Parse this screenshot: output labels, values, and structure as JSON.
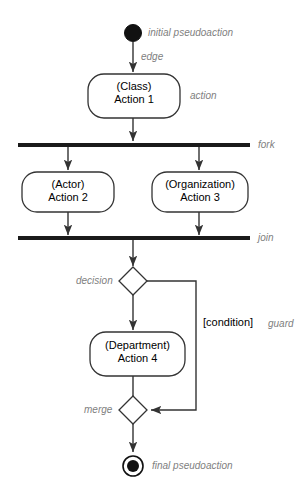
{
  "diagram": {
    "colors": {
      "stroke": "#333333",
      "bar": "#1a1a1a",
      "node_fill": "#ffffff",
      "annotation": "#808080",
      "text": "#000000",
      "background": "#ffffff"
    },
    "nodes": {
      "initial": {
        "type": "initial-node",
        "annotation": "initial pseudoaction"
      },
      "action1": {
        "type": "action",
        "line1": "(Class)",
        "line2": "Action 1",
        "annotation": "action"
      },
      "fork": {
        "type": "fork-bar",
        "annotation": "fork"
      },
      "action2": {
        "type": "action",
        "line1": "(Actor)",
        "line2": "Action 2"
      },
      "action3": {
        "type": "action",
        "line1": "(Organization)",
        "line2": "Action 3"
      },
      "join": {
        "type": "join-bar",
        "annotation": "join"
      },
      "decision": {
        "type": "decision-node",
        "annotation": "decision"
      },
      "action4": {
        "type": "action",
        "line1": "(Department)",
        "line2": "Action 4"
      },
      "merge": {
        "type": "merge-node",
        "annotation": "merge"
      },
      "final": {
        "type": "final-node",
        "annotation": "final pseudoaction"
      }
    },
    "edges": {
      "initial_to_action1": {
        "annotation": "edge"
      },
      "decision_branch": {
        "guard_text": "[condition]",
        "guard_annotation": "guard"
      }
    }
  }
}
